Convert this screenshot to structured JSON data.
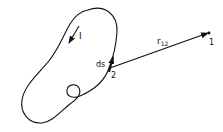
{
  "diagram": {
    "labels": {
      "current": "I",
      "line_element": "ds",
      "source_point": "2",
      "vector": "r",
      "vector_subscript": "12",
      "field_point": "1"
    },
    "colors": {
      "stroke": "#111111",
      "background": "#ffffff"
    }
  }
}
